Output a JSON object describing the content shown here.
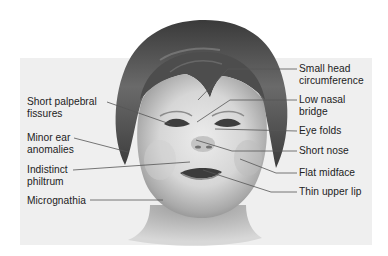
{
  "figure": {
    "band_color": "#efefef",
    "line_color": "#555555",
    "text_color": "#222222"
  },
  "labels_left": [
    {
      "id": "short-palpebral-fissures",
      "lines": [
        "Short palpebral",
        "fissures"
      ]
    },
    {
      "id": "minor-ear-anomalies",
      "lines": [
        "Minor ear",
        "anomalies"
      ]
    },
    {
      "id": "indistinct-philtrum",
      "lines": [
        "Indistinct",
        "philtrum"
      ]
    },
    {
      "id": "micrognathia",
      "lines": [
        "Micrognathia"
      ]
    }
  ],
  "labels_right": [
    {
      "id": "small-head-circumference",
      "lines": [
        "Small head",
        "circumference"
      ]
    },
    {
      "id": "low-nasal-bridge",
      "lines": [
        "Low nasal",
        "bridge"
      ]
    },
    {
      "id": "eye-folds",
      "lines": [
        "Eye folds"
      ]
    },
    {
      "id": "short-nose",
      "lines": [
        "Short nose"
      ]
    },
    {
      "id": "flat-midface",
      "lines": [
        "Flat midface"
      ]
    },
    {
      "id": "thin-upper-lip",
      "lines": [
        "Thin upper lip"
      ]
    }
  ]
}
